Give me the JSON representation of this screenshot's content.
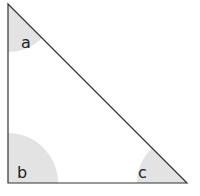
{
  "diagram": {
    "type": "right-triangle",
    "vertices": {
      "top": [
        8,
        4
      ],
      "bottom_left": [
        8,
        183
      ],
      "bottom_right": [
        187,
        183
      ]
    },
    "angles": [
      {
        "label": "a",
        "vertex": "top"
      },
      {
        "label": "b",
        "vertex": "bottom_left"
      },
      {
        "label": "c",
        "vertex": "bottom_right"
      }
    ],
    "colors": {
      "stroke": "#333333",
      "arc_fill": "#e3e3e3"
    }
  }
}
